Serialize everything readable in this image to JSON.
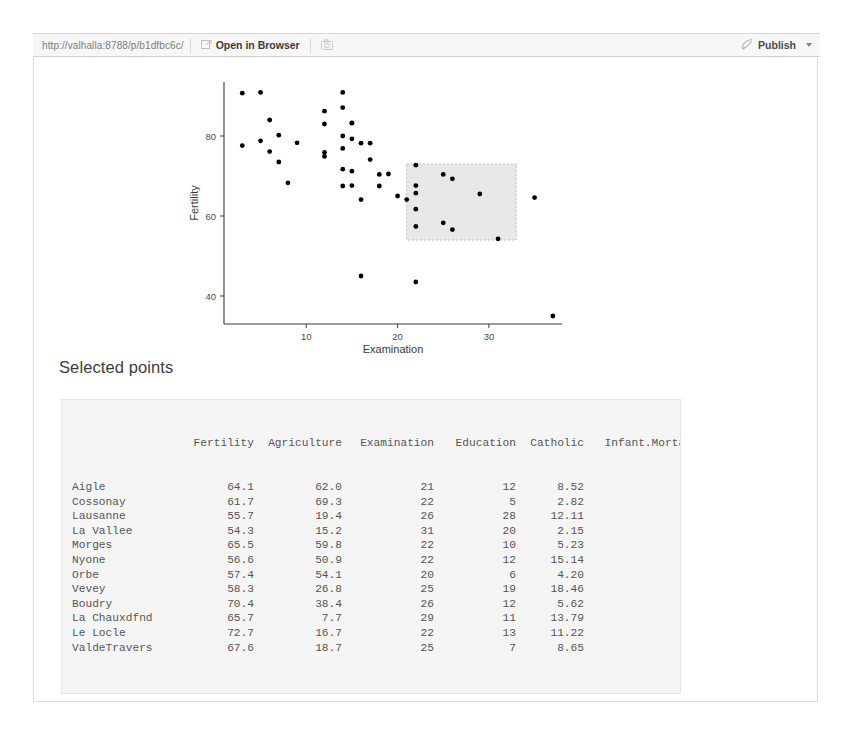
{
  "toolbar": {
    "url": "http://valhalla:8788/p/b1dfbc6c/",
    "refresh_icon": "refresh-icon",
    "open_in_browser_label": "Open in Browser",
    "open_in_browser_icon": "external-window-icon",
    "snapshot_icon": "camera-icon",
    "publish_label": "Publish",
    "publish_icon": "publish-icon",
    "publish_caret": "chevron-down-icon"
  },
  "app": {
    "selected_heading": "Selected points"
  },
  "chart_data": {
    "type": "scatter",
    "title": "",
    "xlabel": "Examination",
    "ylabel": "Fertility",
    "xlim": [
      1,
      38
    ],
    "ylim": [
      33,
      93
    ],
    "xticks": [
      10,
      20,
      30
    ],
    "yticks": [
      40,
      60,
      80
    ],
    "grid": false,
    "legend": null,
    "point_color": "#000000",
    "brush": {
      "x_range": [
        21.0,
        33.0
      ],
      "y_range": [
        54.0,
        73.0
      ],
      "fill": "#e8e8e8",
      "stroke": "#bcbcbc"
    },
    "series": [
      {
        "name": "swiss cantons",
        "points": [
          [
            3,
            90.7
          ],
          [
            5,
            90.9
          ],
          [
            14,
            90.9
          ],
          [
            12,
            86.2
          ],
          [
            14,
            87.1
          ],
          [
            6,
            84.0
          ],
          [
            12,
            83.0
          ],
          [
            15,
            83.2
          ],
          [
            15,
            83.3
          ],
          [
            7,
            80.2
          ],
          [
            14,
            80.0
          ],
          [
            15,
            79.3
          ],
          [
            16,
            78.2
          ],
          [
            5,
            78.8
          ],
          [
            9,
            78.3
          ],
          [
            3,
            77.6
          ],
          [
            17,
            78.2
          ],
          [
            14,
            76.9
          ],
          [
            12,
            75.9
          ],
          [
            6,
            76.1
          ],
          [
            12,
            74.9
          ],
          [
            7,
            73.5
          ],
          [
            17,
            74.1
          ],
          [
            15,
            71.2
          ],
          [
            14,
            71.7
          ],
          [
            18,
            70.4
          ],
          [
            19,
            70.5
          ],
          [
            8,
            68.3
          ],
          [
            14,
            67.5
          ],
          [
            15,
            67.6
          ],
          [
            18,
            67.5
          ],
          [
            16,
            64.1
          ],
          [
            20,
            65.0
          ],
          [
            16,
            45.0
          ],
          [
            22,
            43.5
          ],
          [
            37,
            35.0
          ],
          [
            22,
            72.7
          ],
          [
            25,
            70.4
          ],
          [
            26,
            69.3
          ],
          [
            22,
            67.6
          ],
          [
            22,
            65.7
          ],
          [
            21,
            64.1
          ],
          [
            29,
            65.5
          ],
          [
            35,
            64.6
          ],
          [
            22,
            61.7
          ],
          [
            25,
            58.3
          ],
          [
            26,
            56.6
          ],
          [
            22,
            57.4
          ],
          [
            31,
            54.3
          ]
        ]
      }
    ]
  },
  "table": {
    "columns": [
      "",
      "Fertility",
      "Agriculture",
      "Examination",
      "Education",
      "Catholic",
      "Infant.Mortality"
    ],
    "rows": [
      {
        "name": "Aigle",
        "fertility": "64.1",
        "agriculture": "62.0",
        "examination": "21",
        "education": "12",
        "catholic": "8.52",
        "infant_mortality": "16.5"
      },
      {
        "name": "Cossonay",
        "fertility": "61.7",
        "agriculture": "69.3",
        "examination": "22",
        "education": "5",
        "catholic": "2.82",
        "infant_mortality": "18.7"
      },
      {
        "name": "Lausanne",
        "fertility": "55.7",
        "agriculture": "19.4",
        "examination": "26",
        "education": "28",
        "catholic": "12.11",
        "infant_mortality": "20.2"
      },
      {
        "name": "La Vallee",
        "fertility": "54.3",
        "agriculture": "15.2",
        "examination": "31",
        "education": "20",
        "catholic": "2.15",
        "infant_mortality": "10.8"
      },
      {
        "name": "Morges",
        "fertility": "65.5",
        "agriculture": "59.8",
        "examination": "22",
        "education": "10",
        "catholic": "5.23",
        "infant_mortality": "18.0"
      },
      {
        "name": "Nyone",
        "fertility": "56.6",
        "agriculture": "50.9",
        "examination": "22",
        "education": "12",
        "catholic": "15.14",
        "infant_mortality": "16.7"
      },
      {
        "name": "Orbe",
        "fertility": "57.4",
        "agriculture": "54.1",
        "examination": "20",
        "education": "6",
        "catholic": "4.20",
        "infant_mortality": "15.3"
      },
      {
        "name": "Vevey",
        "fertility": "58.3",
        "agriculture": "26.8",
        "examination": "25",
        "education": "19",
        "catholic": "18.46",
        "infant_mortality": "20.9"
      },
      {
        "name": "Boudry",
        "fertility": "70.4",
        "agriculture": "38.4",
        "examination": "26",
        "education": "12",
        "catholic": "5.62",
        "infant_mortality": "20.3"
      },
      {
        "name": "La Chauxdfnd",
        "fertility": "65.7",
        "agriculture": "7.7",
        "examination": "29",
        "education": "11",
        "catholic": "13.79",
        "infant_mortality": "20.5"
      },
      {
        "name": "Le Locle",
        "fertility": "72.7",
        "agriculture": "16.7",
        "examination": "22",
        "education": "13",
        "catholic": "11.22",
        "infant_mortality": "18.9"
      },
      {
        "name": "ValdeTravers",
        "fertility": "67.6",
        "agriculture": "18.7",
        "examination": "25",
        "education": "7",
        "catholic": "8.65",
        "infant_mortality": "19.5"
      }
    ]
  }
}
